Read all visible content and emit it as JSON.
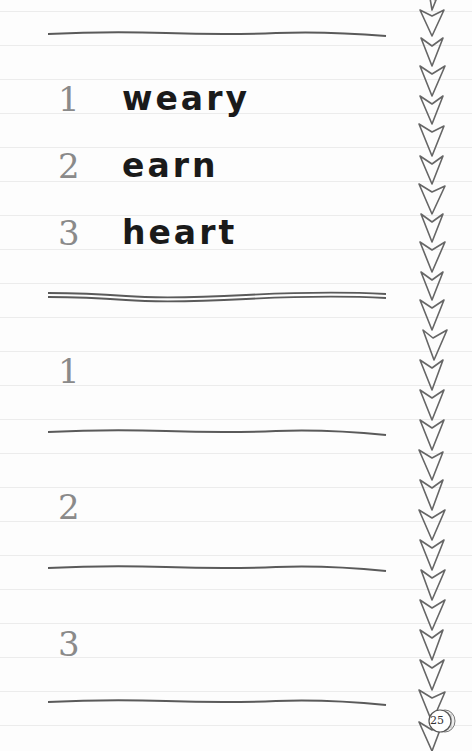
{
  "example_section": {
    "items": [
      {
        "number": "1",
        "word": "weary"
      },
      {
        "number": "2",
        "word": "earn"
      },
      {
        "number": "3",
        "word": "heart"
      }
    ]
  },
  "answer_section": {
    "items": [
      {
        "number": "1",
        "answer": ""
      },
      {
        "number": "2",
        "answer": ""
      },
      {
        "number": "3",
        "answer": ""
      }
    ]
  },
  "decoration": {
    "border": "chevron-arrow-border"
  },
  "footer": {
    "page_number": "25"
  },
  "colors": {
    "ink": "#1a1a1a",
    "number_gray": "#8a8a8a",
    "line_gray": "#555555",
    "ruled_line": "#ececec"
  }
}
